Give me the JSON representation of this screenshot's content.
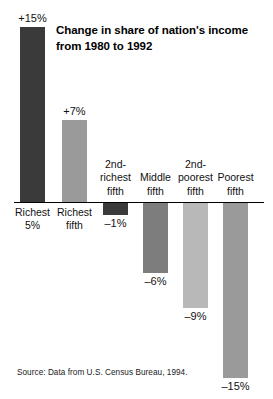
{
  "figure": {
    "top_fragment": "a man are shown.",
    "title": "Change in share of nation's income from 1980 to 1992",
    "source": "Source: Data from U.S. Census Bureau, 1994."
  },
  "chart_data": {
    "type": "bar",
    "title": "Change in share of nation's income from 1980 to 1992",
    "xlabel": "",
    "ylabel": "",
    "unit": "%",
    "grid": false,
    "legend": "none",
    "baseline": 0,
    "ylim": [
      -15,
      15
    ],
    "categories": [
      "Richest 5%",
      "Richest fifth",
      "2nd-richest fifth",
      "Middle fifth",
      "2nd-poorest fifth",
      "Poorest fifth"
    ],
    "values": [
      15,
      7,
      -1,
      -6,
      -9,
      -15
    ],
    "value_labels": [
      "+15%",
      "+7%",
      "–1%",
      "–6%",
      "–9%",
      "–15%"
    ],
    "colors": [
      "#3a3a3a",
      "#9a9a9a",
      "#3a3a3a",
      "#7d7d7d",
      "#b8b8b8",
      "#9a9a9a"
    ],
    "bars": [
      {
        "category": "Richest 5%",
        "category_label": "Richest\n5%",
        "value": 15,
        "value_label": "+15%",
        "color": "#3a3a3a",
        "direction": "up"
      },
      {
        "category": "Richest fifth",
        "category_label": "Richest\nfifth",
        "value": 7,
        "value_label": "+7%",
        "color": "#9a9a9a",
        "direction": "up"
      },
      {
        "category": "2nd-richest fifth",
        "category_label": "2nd-\nrichest\nfifth",
        "value": -1,
        "value_label": "–1%",
        "color": "#3a3a3a",
        "direction": "down"
      },
      {
        "category": "Middle fifth",
        "category_label": "Middle\nfifth",
        "value": -6,
        "value_label": "–6%",
        "color": "#7d7d7d",
        "direction": "down"
      },
      {
        "category": "2nd-poorest fifth",
        "category_label": "2nd-\npoorest\nfifth",
        "value": -9,
        "value_label": "–9%",
        "color": "#b8b8b8",
        "direction": "down"
      },
      {
        "category": "Poorest fifth",
        "category_label": "Poorest\nfifth",
        "value": -15,
        "value_label": "–15%",
        "color": "#9a9a9a",
        "direction": "down"
      }
    ]
  }
}
